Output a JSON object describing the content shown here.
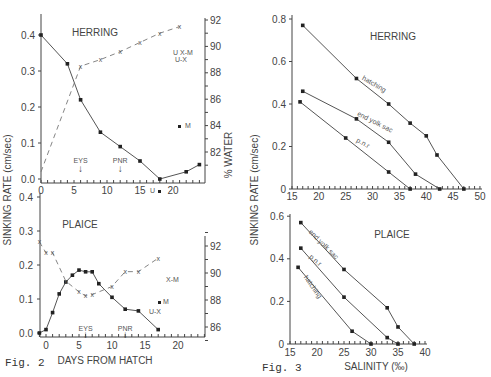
{
  "figures": {
    "fig2_label": "Fig. 2",
    "fig3_label": "Fig. 3",
    "fig2_xlabel": "DAYS FROM HATCH",
    "fig2_ylabel_left": "SINKING RATE (cm/sec)",
    "fig2_ylabel_right": "% WATER",
    "fig3_xlabel": "SALINITY (‰)",
    "fig3_ylabel": "SINKING RATE (cm/sec)",
    "herring_title": "HERRING",
    "plaice_title": "PLAICE",
    "eys": "EYS",
    "pnr": "PNR",
    "hatching": "hatching",
    "end_yolk_sac": "end yolk sac",
    "pnr_lower": "p.n.r"
  },
  "chart_data": [
    {
      "type": "line",
      "title": "Fig. 2 HERRING",
      "xlabel": "DAYS FROM HATCH",
      "ylabel": "SINKING RATE (cm/sec)",
      "ylabel_right": "% WATER",
      "xlim": [
        0,
        24
      ],
      "ylim": [
        0,
        0.4
      ],
      "ylim_right": [
        80,
        92
      ],
      "x_ticks": [
        0,
        5,
        10,
        15,
        20
      ],
      "y_ticks": [
        "0.0",
        "0.1",
        "0.2",
        "0.3",
        "0.4"
      ],
      "y_right_ticks": [
        82,
        84,
        86,
        88,
        90,
        92
      ],
      "annotations": [
        {
          "text": "EYS",
          "x": 6
        },
        {
          "text": "PNR",
          "x": 12
        },
        {
          "text": "U-X",
          "x": 21,
          "y_right": 88.3
        },
        {
          "text": "X-M",
          "x": 21,
          "y_right": 88.8
        },
        {
          "text": "M",
          "x": 21,
          "y": 0.12
        },
        {
          "text": "U",
          "x": 18,
          "y": -0.01
        }
      ],
      "series": [
        {
          "name": "sinking rate",
          "style": "solid",
          "x": [
            0,
            4,
            6,
            9,
            12,
            15,
            18,
            22,
            24
          ],
          "values": [
            0.4,
            0.32,
            0.22,
            0.13,
            0.09,
            0.05,
            0.0,
            0.02,
            0.04
          ]
        },
        {
          "name": "% water",
          "style": "dashed",
          "axis": "right",
          "x": [
            0,
            6,
            9,
            12,
            15,
            18,
            21
          ],
          "values": [
            80.5,
            88.5,
            89.0,
            89.6,
            90.3,
            91.0,
            91.5
          ]
        }
      ]
    },
    {
      "type": "line",
      "title": "Fig. 2 PLAICE",
      "xlabel": "DAYS FROM HATCH",
      "ylabel": "SINKING RATE (cm/sec)",
      "ylabel_right": "% WATER",
      "xlim": [
        -1,
        24
      ],
      "ylim": [
        0,
        0.4
      ],
      "ylim_right": [
        85,
        93
      ],
      "x_ticks": [
        0,
        5,
        10,
        15,
        20
      ],
      "y_ticks": [
        "0.0",
        "0.1",
        "0.2",
        "0.3",
        "0.4"
      ],
      "y_right_ticks": [
        86,
        88,
        90,
        92
      ],
      "annotations": [
        {
          "text": "EYS",
          "x": 6
        },
        {
          "text": "PNR",
          "x": 12
        },
        {
          "text": "X-M",
          "x": 17.5,
          "y_right": 89.7
        },
        {
          "text": "M",
          "x": 17.5,
          "y": 0.09
        },
        {
          "text": "U-X",
          "x": 17,
          "y_right": 87.3
        }
      ],
      "series": [
        {
          "name": "sinking rate",
          "style": "solid",
          "x": [
            -1,
            0,
            1,
            2,
            3,
            4,
            5,
            6,
            7,
            8,
            10,
            12,
            14,
            17
          ],
          "values": [
            0.0,
            0.01,
            0.06,
            0.115,
            0.15,
            0.17,
            0.185,
            0.18,
            0.18,
            0.145,
            0.105,
            0.07,
            0.065,
            0.01
          ]
        },
        {
          "name": "% water",
          "style": "dashed",
          "axis": "right",
          "x": [
            -1,
            0,
            1,
            3,
            5,
            6,
            7,
            10,
            12,
            14,
            17
          ],
          "values": [
            92.3,
            91.5,
            91.5,
            89.4,
            88.6,
            88.3,
            88.4,
            89.0,
            90.1,
            90.1,
            91.1
          ]
        }
      ]
    },
    {
      "type": "line",
      "title": "Fig. 3 HERRING",
      "xlabel": "SALINITY (‰)",
      "ylabel": "SINKING RATE (cm/sec)",
      "xlim": [
        15,
        50
      ],
      "ylim": [
        0,
        0.8
      ],
      "x_ticks": [
        15,
        20,
        25,
        30,
        35,
        40,
        45,
        50
      ],
      "y_ticks": [
        "0",
        "0.2",
        "0.4",
        "0.6",
        "0.8"
      ],
      "series": [
        {
          "name": "hatching",
          "x": [
            17,
            27,
            33,
            37,
            40,
            42,
            47
          ],
          "values": [
            0.77,
            0.52,
            0.4,
            0.31,
            0.25,
            0.16,
            0.0
          ]
        },
        {
          "name": "end yolk sac",
          "x": [
            17,
            27,
            33,
            38,
            42.5
          ],
          "values": [
            0.46,
            0.33,
            0.22,
            0.07,
            0.0
          ]
        },
        {
          "name": "p.n.r",
          "x": [
            16.5,
            25,
            33,
            37
          ],
          "values": [
            0.41,
            0.24,
            0.08,
            0.0
          ]
        }
      ]
    },
    {
      "type": "line",
      "title": "Fig. 3 PLAICE",
      "xlabel": "SALINITY (‰)",
      "ylabel": "SINKING RATE (cm/sec)",
      "xlim": [
        15,
        40
      ],
      "ylim": [
        0,
        0.6
      ],
      "x_ticks": [
        15,
        20,
        25,
        30,
        35,
        40
      ],
      "y_ticks": [
        "0",
        "0.2",
        "0.4",
        "0.6"
      ],
      "series": [
        {
          "name": "end yolk sac",
          "x": [
            17,
            25,
            33,
            35,
            38
          ],
          "values": [
            0.57,
            0.35,
            0.17,
            0.08,
            0.0
          ]
        },
        {
          "name": "p.n.r",
          "x": [
            17,
            25,
            33,
            35
          ],
          "values": [
            0.45,
            0.22,
            0.03,
            0.0
          ]
        },
        {
          "name": "hatching",
          "x": [
            16.5,
            26.5,
            30
          ],
          "values": [
            0.36,
            0.06,
            0.0
          ]
        }
      ]
    }
  ]
}
